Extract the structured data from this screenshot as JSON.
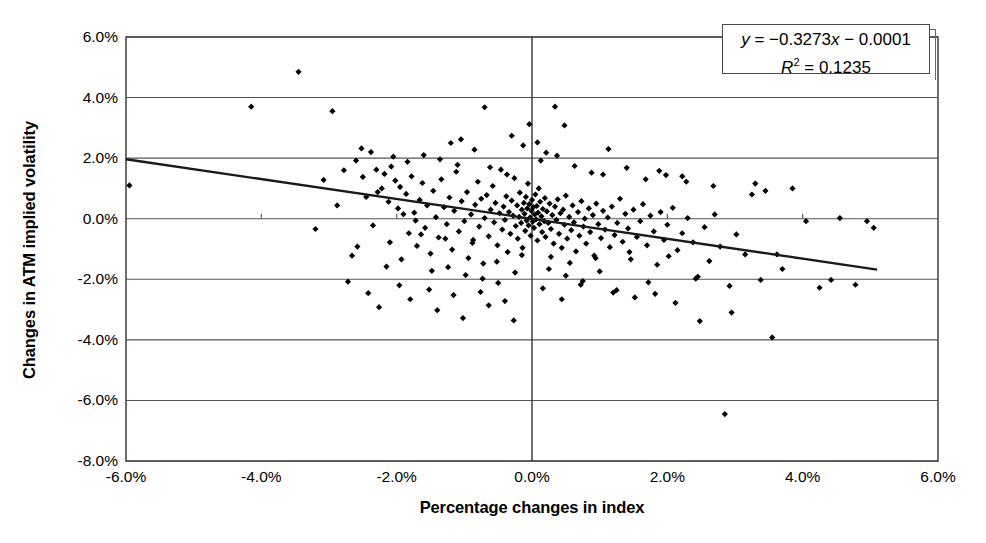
{
  "chart_data": {
    "type": "scatter",
    "title": "",
    "xlabel": "Percentage changes in index",
    "ylabel": "Changes in ATM implied volatility",
    "xlim": [
      -6.0,
      6.0
    ],
    "ylim": [
      -8.0,
      6.0
    ],
    "xticks": [
      "-6.0%",
      "-4.0%",
      "-2.0%",
      "0.0%",
      "2.0%",
      "4.0%",
      "6.0%"
    ],
    "xtick_values": [
      -6.0,
      -4.0,
      -2.0,
      0.0,
      2.0,
      4.0,
      6.0
    ],
    "yticks": [
      "6.0%",
      "4.0%",
      "2.0%",
      "0.0%",
      "-2.0%",
      "-4.0%",
      "-6.0%",
      "-8.0%"
    ],
    "ytick_values": [
      6.0,
      4.0,
      2.0,
      0.0,
      -2.0,
      -4.0,
      -6.0,
      -8.0
    ],
    "grid": "horizontal",
    "marker": "diamond",
    "marker_color": "#000000",
    "legend_position": "top-right",
    "annotations": {
      "equation": "y = −0.3273x − 0.0001",
      "equation_y": "y",
      "equation_rest": " = −0.3273",
      "equation_x": "x",
      "equation_tail": " − 0.0001",
      "r_squared_label": "R",
      "r_squared_exp": "2",
      "r_squared_value": " = 0.1235",
      "r_squared": "R² = 0.1235"
    },
    "trendline": {
      "slope": -0.3273,
      "intercept": -0.0001,
      "x_start": -6.0,
      "y_start": 1.963,
      "x_end": 5.1,
      "y_end": -1.679,
      "color": "#1a1a1a",
      "width": 2.4
    },
    "series": [
      {
        "name": "Index change vs ATM implied volatility change",
        "points": [
          [
            -5.95,
            1.1
          ],
          [
            -3.45,
            4.85
          ],
          [
            -4.15,
            3.7
          ],
          [
            -2.95,
            3.55
          ],
          [
            -2.52,
            2.32
          ],
          [
            -2.38,
            2.2
          ],
          [
            -2.3,
            1.62
          ],
          [
            -2.22,
            1.0
          ],
          [
            -2.18,
            1.48
          ],
          [
            -2.12,
            0.56
          ],
          [
            -2.08,
            1.72
          ],
          [
            -2.02,
            1.26
          ],
          [
            -1.98,
            0.34
          ],
          [
            -1.95,
            1.05
          ],
          [
            -1.9,
            0.15
          ],
          [
            -1.86,
            0.82
          ],
          [
            -1.82,
            -0.48
          ],
          [
            -1.78,
            1.4
          ],
          [
            -1.74,
            0.2
          ],
          [
            -1.7,
            -0.9
          ],
          [
            -1.66,
            0.62
          ],
          [
            -1.62,
            1.18
          ],
          [
            -1.58,
            -0.3
          ],
          [
            -1.55,
            0.44
          ],
          [
            -1.5,
            -1.15
          ],
          [
            -1.46,
            0.92
          ],
          [
            -1.42,
            0.05
          ],
          [
            -1.38,
            -0.62
          ],
          [
            -1.34,
            1.3
          ],
          [
            -1.3,
            0.38
          ],
          [
            -1.26,
            -0.18
          ],
          [
            -1.22,
            0.7
          ],
          [
            -1.18,
            -1.02
          ],
          [
            -1.15,
            0.26
          ],
          [
            -1.12,
            1.55
          ],
          [
            -1.08,
            -0.42
          ],
          [
            -1.04,
            0.58
          ],
          [
            -1.0,
            -0.08
          ],
          [
            -0.96,
            0.88
          ],
          [
            -0.94,
            -1.3
          ],
          [
            -0.9,
            0.14
          ],
          [
            -0.87,
            -0.7
          ],
          [
            -0.84,
            0.46
          ],
          [
            -0.8,
            1.22
          ],
          [
            -0.78,
            -0.26
          ],
          [
            -0.75,
            0.66
          ],
          [
            -0.72,
            -1.48
          ],
          [
            -0.7,
            0.02
          ],
          [
            -0.67,
            0.78
          ],
          [
            -0.64,
            -0.58
          ],
          [
            -0.61,
            0.3
          ],
          [
            -0.58,
            1.08
          ],
          [
            -0.56,
            -0.12
          ],
          [
            -0.54,
            0.52
          ],
          [
            -0.51,
            -0.88
          ],
          [
            -0.48,
            0.18
          ],
          [
            -0.46,
            1.62
          ],
          [
            -0.44,
            -0.36
          ],
          [
            -0.42,
            0.4
          ],
          [
            -0.4,
            -0.04
          ],
          [
            -0.38,
            0.74
          ],
          [
            -0.36,
            -1.1
          ],
          [
            -0.34,
            0.22
          ],
          [
            -0.32,
            -0.5
          ],
          [
            -0.3,
            0.6
          ],
          [
            -0.28,
            0.1
          ],
          [
            -0.26,
            1.34
          ],
          [
            -0.24,
            -0.24
          ],
          [
            -0.22,
            0.44
          ],
          [
            -0.21,
            -0.66
          ],
          [
            -0.19,
            0.06
          ],
          [
            -0.18,
            0.86
          ],
          [
            -0.16,
            -0.14
          ],
          [
            -0.15,
            0.3
          ],
          [
            -0.14,
            -0.96
          ],
          [
            -0.12,
            0.52
          ],
          [
            -0.11,
            0.16
          ],
          [
            -0.1,
            -0.4
          ],
          [
            -0.09,
            0.72
          ],
          [
            -0.08,
            -0.06
          ],
          [
            -0.07,
            0.34
          ],
          [
            -0.06,
            1.16
          ],
          [
            -0.05,
            -0.22
          ],
          [
            -0.04,
            0.48
          ],
          [
            -0.03,
            0.04
          ],
          [
            -0.02,
            -0.56
          ],
          [
            -0.01,
            0.26
          ],
          [
            0.0,
            0.62
          ],
          [
            0.01,
            -0.1
          ],
          [
            0.02,
            0.38
          ],
          [
            0.03,
            -0.3
          ],
          [
            0.04,
            0.14
          ],
          [
            0.05,
            0.8
          ],
          [
            0.06,
            -0.02
          ],
          [
            0.07,
            0.42
          ],
          [
            0.08,
            -0.72
          ],
          [
            0.09,
            0.2
          ],
          [
            0.1,
            1.0
          ],
          [
            0.11,
            -0.18
          ],
          [
            0.12,
            0.56
          ],
          [
            0.14,
            0.08
          ],
          [
            0.15,
            -0.44
          ],
          [
            0.16,
            0.32
          ],
          [
            0.18,
            -0.08
          ],
          [
            0.19,
            0.68
          ],
          [
            0.2,
            -0.6
          ],
          [
            0.22,
            0.24
          ],
          [
            0.24,
            -0.14
          ],
          [
            0.26,
            0.5
          ],
          [
            0.28,
            -0.34
          ],
          [
            0.3,
            0.12
          ],
          [
            0.32,
            -0.82
          ],
          [
            0.34,
            0.4
          ],
          [
            0.36,
            -0.04
          ],
          [
            0.38,
            0.64
          ],
          [
            0.4,
            -0.5
          ],
          [
            0.42,
            0.18
          ],
          [
            0.44,
            -0.96
          ],
          [
            0.46,
            0.3
          ],
          [
            0.48,
            -0.2
          ],
          [
            0.5,
            0.76
          ],
          [
            0.52,
            -0.66
          ],
          [
            0.55,
            0.06
          ],
          [
            0.58,
            -0.38
          ],
          [
            0.6,
            0.44
          ],
          [
            0.62,
            -0.12
          ],
          [
            0.65,
            -1.08
          ],
          [
            0.68,
            0.22
          ],
          [
            0.7,
            -0.56
          ],
          [
            0.73,
            0.58
          ],
          [
            0.76,
            -0.26
          ],
          [
            0.78,
            0.0
          ],
          [
            0.8,
            -0.82
          ],
          [
            0.84,
            0.34
          ],
          [
            0.86,
            -0.44
          ],
          [
            0.9,
            0.12
          ],
          [
            0.92,
            -1.22
          ],
          [
            0.95,
            0.5
          ],
          [
            0.98,
            -0.18
          ],
          [
            1.02,
            -0.64
          ],
          [
            1.05,
            0.26
          ],
          [
            1.08,
            -0.36
          ],
          [
            1.12,
            0.04
          ],
          [
            1.15,
            -0.94
          ],
          [
            1.18,
            0.4
          ],
          [
            1.22,
            -0.54
          ],
          [
            1.26,
            -0.14
          ],
          [
            1.3,
            0.66
          ],
          [
            1.34,
            -0.76
          ],
          [
            1.38,
            0.16
          ],
          [
            1.42,
            -0.32
          ],
          [
            1.46,
            -1.34
          ],
          [
            1.5,
            0.3
          ],
          [
            1.55,
            -0.6
          ],
          [
            1.6,
            -0.08
          ],
          [
            1.64,
            0.48
          ],
          [
            1.7,
            -0.88
          ],
          [
            1.75,
            0.1
          ],
          [
            1.8,
            -0.42
          ],
          [
            1.85,
            -1.52
          ],
          [
            1.9,
            0.22
          ],
          [
            1.95,
            -0.7
          ],
          [
            2.0,
            -0.2
          ],
          [
            2.08,
            0.36
          ],
          [
            2.15,
            -1.04
          ],
          [
            2.22,
            -0.48
          ],
          [
            2.3,
            0.02
          ],
          [
            2.38,
            -0.78
          ],
          [
            2.45,
            -1.92
          ],
          [
            2.55,
            -0.28
          ],
          [
            2.62,
            -1.4
          ],
          [
            2.7,
            0.14
          ],
          [
            2.78,
            -0.92
          ],
          [
            2.85,
            -6.45
          ],
          [
            2.92,
            -2.22
          ],
          [
            3.02,
            -0.52
          ],
          [
            3.15,
            -1.18
          ],
          [
            3.25,
            0.8
          ],
          [
            3.38,
            -2.02
          ],
          [
            3.45,
            0.92
          ],
          [
            3.55,
            -3.92
          ],
          [
            3.7,
            -1.66
          ],
          [
            3.85,
            1.0
          ],
          [
            4.05,
            -0.08
          ],
          [
            4.25,
            -2.28
          ],
          [
            4.55,
            0.02
          ],
          [
            4.78,
            -2.18
          ],
          [
            4.95,
            -0.08
          ],
          [
            5.05,
            -0.3
          ],
          [
            -2.6,
            1.92
          ],
          [
            -2.45,
            0.72
          ],
          [
            -2.35,
            -0.22
          ],
          [
            -2.28,
            0.88
          ],
          [
            -2.15,
            -1.58
          ],
          [
            -2.05,
            2.05
          ],
          [
            -1.93,
            -1.34
          ],
          [
            -1.84,
            1.88
          ],
          [
            -1.72,
            -0.06
          ],
          [
            -1.6,
            2.1
          ],
          [
            -1.48,
            -1.72
          ],
          [
            -1.36,
            1.96
          ],
          [
            -1.24,
            -1.6
          ],
          [
            -1.1,
            1.78
          ],
          [
            -0.98,
            -1.86
          ],
          [
            -0.85,
            2.28
          ],
          [
            -0.73,
            -1.98
          ],
          [
            -0.62,
            1.7
          ],
          [
            -0.5,
            -2.12
          ],
          [
            -0.37,
            1.46
          ],
          [
            -0.25,
            -1.78
          ],
          [
            -0.13,
            2.42
          ],
          [
            0.13,
            1.92
          ],
          [
            0.25,
            -1.66
          ],
          [
            0.37,
            2.08
          ],
          [
            0.5,
            -1.88
          ],
          [
            0.63,
            1.74
          ],
          [
            0.75,
            -2.06
          ],
          [
            0.88,
            1.52
          ],
          [
            1.0,
            -1.74
          ],
          [
            1.13,
            2.3
          ],
          [
            1.25,
            -2.36
          ],
          [
            1.4,
            1.68
          ],
          [
            1.52,
            -2.6
          ],
          [
            1.68,
            1.3
          ],
          [
            1.82,
            -2.48
          ],
          [
            1.98,
            1.44
          ],
          [
            2.12,
            -2.78
          ],
          [
            2.28,
            1.22
          ],
          [
            2.48,
            -3.38
          ],
          [
            2.68,
            1.08
          ],
          [
            2.95,
            -3.1
          ],
          [
            3.3,
            1.16
          ],
          [
            -2.72,
            -2.08
          ],
          [
            -2.58,
            -0.92
          ],
          [
            -2.42,
            -2.46
          ],
          [
            -2.26,
            -2.92
          ],
          [
            -2.1,
            -0.78
          ],
          [
            -1.96,
            -2.2
          ],
          [
            -1.8,
            -2.66
          ],
          [
            -1.64,
            -0.52
          ],
          [
            -1.52,
            -2.34
          ],
          [
            -1.4,
            -3.02
          ],
          [
            -1.28,
            -0.66
          ],
          [
            -1.16,
            -2.52
          ],
          [
            -1.02,
            -3.28
          ],
          [
            -0.88,
            -0.8
          ],
          [
            -0.76,
            -2.42
          ],
          [
            -0.64,
            -2.86
          ],
          [
            -0.52,
            -1.42
          ],
          [
            -0.4,
            -2.72
          ],
          [
            -0.27,
            -3.36
          ],
          [
            -0.15,
            -1.2
          ],
          [
            0.16,
            -2.3
          ],
          [
            0.28,
            -1.26
          ],
          [
            0.44,
            -2.66
          ],
          [
            0.56,
            -1.46
          ],
          [
            0.72,
            -2.18
          ],
          [
            0.94,
            -1.3
          ],
          [
            1.2,
            -2.44
          ],
          [
            1.44,
            -1.1
          ],
          [
            1.72,
            -2.1
          ],
          [
            2.02,
            -1.24
          ],
          [
            2.42,
            -1.98
          ],
          [
            -3.08,
            1.28
          ],
          [
            -3.2,
            -0.34
          ],
          [
            -2.88,
            0.44
          ],
          [
            -2.78,
            1.6
          ],
          [
            -2.66,
            -1.22
          ],
          [
            -2.5,
            1.38
          ],
          [
            0.21,
            2.18
          ],
          [
            0.08,
            2.52
          ],
          [
            -0.04,
            3.12
          ],
          [
            0.34,
            3.7
          ],
          [
            0.48,
            3.08
          ],
          [
            -0.7,
            3.68
          ],
          [
            -1.05,
            2.62
          ],
          [
            -0.3,
            2.74
          ],
          [
            1.88,
            1.58
          ],
          [
            2.22,
            1.4
          ],
          [
            1.05,
            1.46
          ],
          [
            -1.2,
            2.5
          ],
          [
            3.62,
            -1.18
          ],
          [
            4.42,
            -2.02
          ]
        ]
      }
    ]
  },
  "axes": {
    "frame_color": "#4a4a4a",
    "grid_color": "#555555",
    "zero_line_color": "#333333"
  }
}
